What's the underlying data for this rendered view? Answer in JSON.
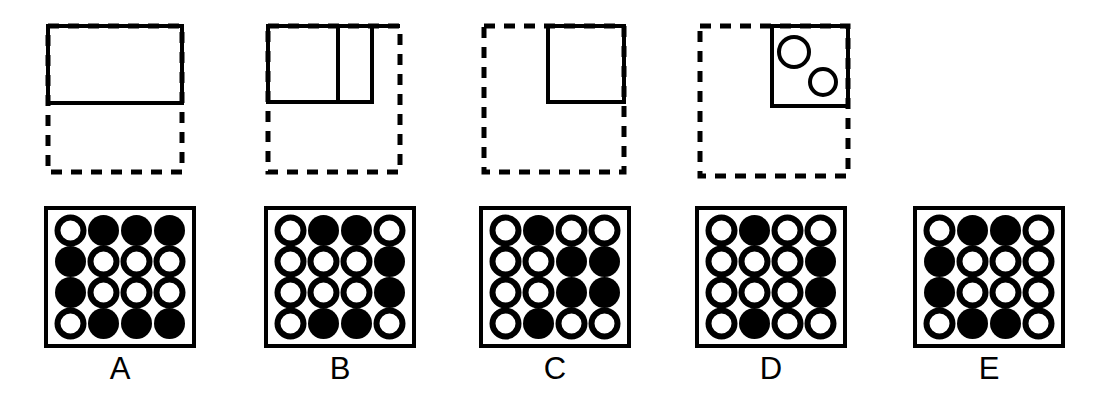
{
  "page": {
    "width": 1102,
    "height": 416,
    "background_color": "#ffffff",
    "ink_color": "#000000"
  },
  "figure_style": {
    "solid_stroke_width": 4,
    "dashed_stroke_width": 5,
    "dash_pattern": "11 9",
    "grid_border_width": 4,
    "dot_radius": 13,
    "dot_ring_width": 6
  },
  "options": [
    {
      "id": "A",
      "label": "A",
      "column_left": 0,
      "label_top": 352,
      "top_figure": {
        "name": "figure-a",
        "x": 48,
        "y": 26,
        "size_w": 134,
        "size_h": 146,
        "dashed_square": {
          "x": 48,
          "y": 26,
          "w": 134,
          "h": 146
        },
        "solid_shapes": [
          {
            "kind": "rect",
            "x": 48,
            "y": 26,
            "w": 134,
            "h": 77
          }
        ],
        "dividers": [],
        "circles": []
      },
      "grid": {
        "name": "grid-a",
        "x": 44,
        "y": 206,
        "w": 152,
        "h": 142,
        "rows": [
          [
            "open",
            "filled",
            "filled",
            "filled"
          ],
          [
            "filled",
            "open",
            "open",
            "open"
          ],
          [
            "filled",
            "open",
            "open",
            "open"
          ],
          [
            "open",
            "filled",
            "filled",
            "filled"
          ]
        ]
      }
    },
    {
      "id": "B",
      "label": "B",
      "column_left": 0,
      "label_top": 352,
      "top_figure": {
        "name": "figure-b",
        "x": 268,
        "y": 26,
        "size_w": 132,
        "size_h": 146,
        "dashed_square": {
          "x": 268,
          "y": 26,
          "w": 132,
          "h": 146
        },
        "solid_shapes": [
          {
            "kind": "rect",
            "x": 268,
            "y": 26,
            "w": 104,
            "h": 76
          }
        ],
        "dividers": [
          {
            "kind": "vline",
            "x": 338,
            "y1": 26,
            "y2": 102
          }
        ],
        "top_extension": {
          "x1": 268,
          "x2": 400,
          "y": 26
        },
        "circles": []
      },
      "grid": {
        "name": "grid-b",
        "x": 264,
        "y": 206,
        "w": 152,
        "h": 142,
        "rows": [
          [
            "open",
            "filled",
            "filled",
            "open"
          ],
          [
            "open",
            "open",
            "open",
            "filled"
          ],
          [
            "open",
            "open",
            "open",
            "filled"
          ],
          [
            "open",
            "filled",
            "filled",
            "open"
          ]
        ]
      }
    },
    {
      "id": "C",
      "label": "C",
      "column_left": 0,
      "label_top": 352,
      "top_figure": {
        "name": "figure-c",
        "x": 484,
        "y": 26,
        "size_w": 140,
        "size_h": 146,
        "dashed_square": {
          "x": 484,
          "y": 26,
          "w": 140,
          "h": 146
        },
        "solid_shapes": [
          {
            "kind": "rect",
            "x": 548,
            "y": 26,
            "w": 76,
            "h": 76
          }
        ],
        "dividers": [],
        "circles": []
      },
      "grid": {
        "name": "grid-c",
        "x": 479,
        "y": 206,
        "w": 152,
        "h": 142,
        "rows": [
          [
            "open",
            "filled",
            "open",
            "open"
          ],
          [
            "open",
            "open",
            "filled",
            "filled"
          ],
          [
            "open",
            "open",
            "filled",
            "filled"
          ],
          [
            "open",
            "filled",
            "open",
            "open"
          ]
        ]
      }
    },
    {
      "id": "D",
      "label": "D",
      "column_left": 0,
      "label_top": 352,
      "top_figure": {
        "name": "figure-d",
        "x": 700,
        "y": 26,
        "size_w": 148,
        "size_h": 150,
        "dashed_square": {
          "x": 700,
          "y": 26,
          "w": 148,
          "h": 150
        },
        "solid_shapes": [
          {
            "kind": "rect",
            "x": 772,
            "y": 26,
            "w": 76,
            "h": 80
          }
        ],
        "dividers": [],
        "circles": [
          {
            "cx": 794,
            "cy": 52,
            "r": 15,
            "fill": "open"
          },
          {
            "cx": 823,
            "cy": 82,
            "r": 13,
            "fill": "open"
          }
        ]
      },
      "grid": {
        "name": "grid-d",
        "x": 695,
        "y": 206,
        "w": 152,
        "h": 142,
        "rows": [
          [
            "open",
            "filled",
            "open",
            "open"
          ],
          [
            "open",
            "open",
            "open",
            "filled"
          ],
          [
            "open",
            "open",
            "open",
            "filled"
          ],
          [
            "open",
            "filled",
            "open",
            "open"
          ]
        ]
      }
    },
    {
      "id": "E",
      "label": "E",
      "column_left": 0,
      "label_top": 352,
      "top_figure": null,
      "grid": {
        "name": "grid-e",
        "x": 913,
        "y": 206,
        "w": 152,
        "h": 142,
        "rows": [
          [
            "open",
            "filled",
            "filled",
            "open"
          ],
          [
            "filled",
            "open",
            "open",
            "open"
          ],
          [
            "filled",
            "open",
            "open",
            "open"
          ],
          [
            "open",
            "filled",
            "filled",
            "open"
          ]
        ]
      }
    }
  ]
}
